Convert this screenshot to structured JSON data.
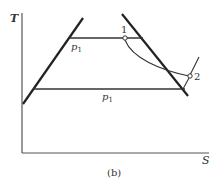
{
  "figure": {
    "caption": "(b)",
    "axes": {
      "y_label": "T",
      "x_label": "S"
    },
    "lines": {
      "upper_isobar_label": "p1",
      "lower_isobar_label": "p1"
    },
    "points": [
      {
        "id": "1",
        "label": "1"
      },
      {
        "id": "2",
        "label": "2"
      }
    ],
    "colors": {
      "line": "#222222",
      "axis": "#555555",
      "text": "#333333"
    }
  }
}
